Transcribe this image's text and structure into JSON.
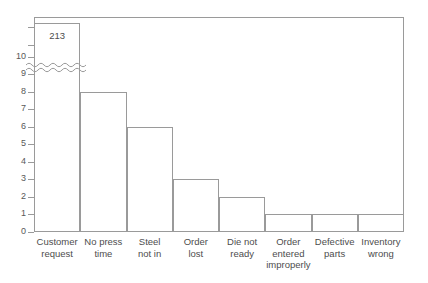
{
  "chart_data": {
    "type": "bar",
    "title": "",
    "subtitle": "",
    "xlabel": "",
    "ylabel": "",
    "categories": [
      "Customer\nrequest",
      "No press\ntime",
      "Steel\nnot in",
      "Order\nlost",
      "Die not\nready",
      "Order\nentered\nimproperly",
      "Defective\nparts",
      "Inventory\nwrong"
    ],
    "values": [
      213,
      8,
      6,
      3,
      2,
      1,
      1,
      1
    ],
    "data_labels": [
      "213",
      "",
      "",
      "",
      "",
      "",
      "",
      ""
    ],
    "ylim": [
      0,
      10
    ],
    "y_ticks": [
      "0",
      "1",
      "2",
      "3",
      "4",
      "5",
      "6",
      "7",
      "8",
      "9",
      "10"
    ],
    "grid": false,
    "legend": false,
    "legend_position": "none",
    "axis_break": {
      "present": true,
      "style": "double-wavy",
      "below_value": 10,
      "note": "first bar truncated; actual value shown as data label"
    },
    "annotations": [
      {
        "text": "213",
        "target_category": "Customer request"
      }
    ]
  },
  "style": {
    "line_color": "#9a9a9a",
    "text_color": "#4d4d4d",
    "tick_label_color": "#585858",
    "bar_fill": "#ffffff",
    "background": "#ffffff"
  }
}
